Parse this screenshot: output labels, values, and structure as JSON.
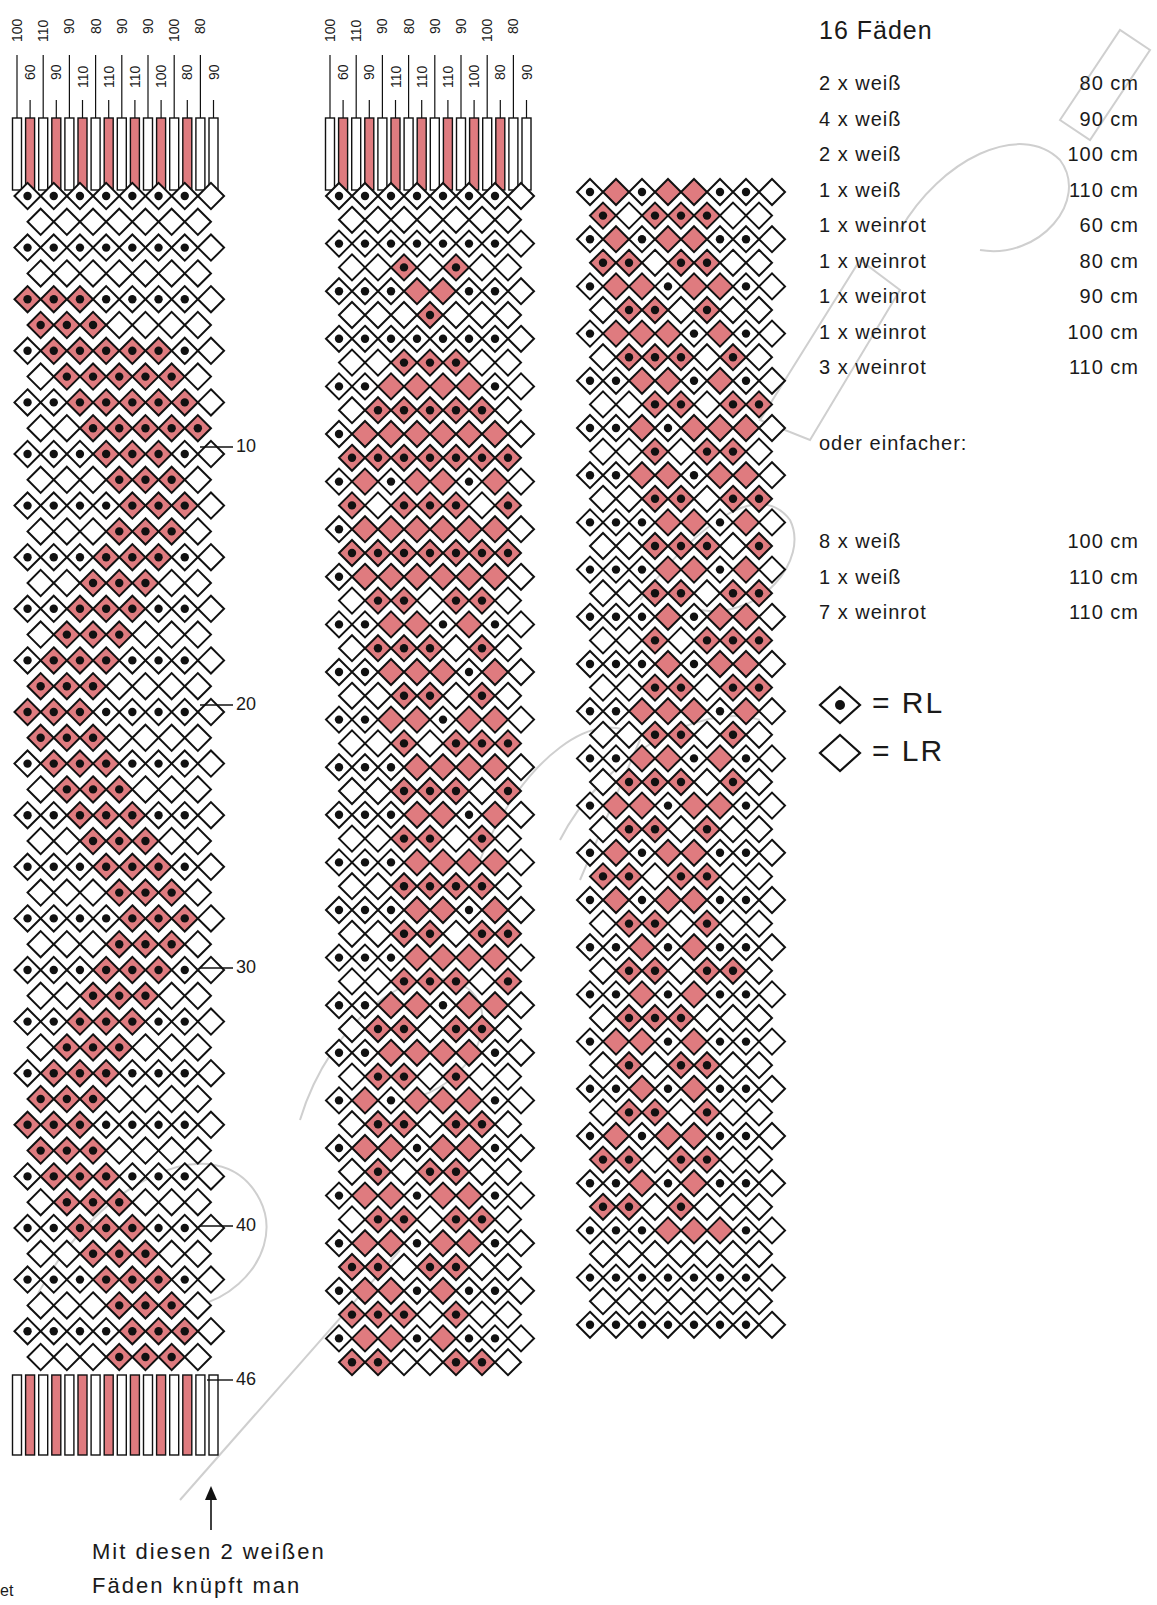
{
  "title": "16 Fäden",
  "colors": {
    "white_thread": "#ffffff",
    "red_thread": "#df7b7f",
    "outline": "#111111",
    "watermark": "#c8c8c8"
  },
  "materials": [
    {
      "qty": "2 x weiß",
      "length": "80 cm"
    },
    {
      "qty": "4 x weiß",
      "length": "90 cm"
    },
    {
      "qty": "2 x weiß",
      "length": "100 cm"
    },
    {
      "qty": "1 x weiß",
      "length": "110 cm"
    },
    {
      "qty": "1 x weinrot",
      "length": "60 cm"
    },
    {
      "qty": "1 x weinrot",
      "length": "80 cm"
    },
    {
      "qty": "1 x weinrot",
      "length": "90 cm"
    },
    {
      "qty": "1 x weinrot",
      "length": "100 cm"
    },
    {
      "qty": "3 x weinrot",
      "length": "110 cm"
    }
  ],
  "simpler_heading": "oder einfacher:",
  "simpler_materials": [
    {
      "qty": "8 x weiß",
      "length": "100 cm"
    },
    {
      "qty": "1 x weiß",
      "length": "110 cm"
    },
    {
      "qty": "7 x weinrot",
      "length": "110 cm"
    }
  ],
  "legend": [
    {
      "symbol": "dotted-diamond",
      "label": "= RL"
    },
    {
      "symbol": "plain-diamond",
      "label": "= LR"
    }
  ],
  "thread_lengths_top": [
    "100",
    "60",
    "110",
    "90",
    "90",
    "110",
    "80",
    "110",
    "90",
    "110",
    "90",
    "100",
    "100",
    "80",
    "80",
    "90"
  ],
  "thread_colors": [
    "w",
    "r",
    "w",
    "r",
    "w",
    "r",
    "w",
    "r",
    "w",
    "r",
    "w",
    "r",
    "w",
    "r",
    "w",
    "w"
  ],
  "row_markers": [
    {
      "label": "10",
      "row": 10
    },
    {
      "label": "20",
      "row": 20
    },
    {
      "label": "30",
      "row": 30
    },
    {
      "label": "40",
      "row": 40
    },
    {
      "label": "46",
      "row": 46
    }
  ],
  "arrow_note": [
    "Mit diesen 2 weißen",
    "Fäden knüpft man"
  ],
  "cut_text": "et",
  "patterns": {
    "left": {
      "rows": 46,
      "description": "Full diamond/zigzag grid, weinrot band forming X then zigzag"
    },
    "middle": {
      "rows": [
        "d d d d d d d .",
        " . . . . . . .",
        "d d d d d d d .",
        " . . R . R . .",
        "d d d r r d d .",
        " . . . R . . .",
        "d d d d d d d .",
        " . . R R R . .",
        "d d r r r r d .",
        " . R R R R R .",
        "d r r r r r r .",
        " R R R R R R R",
        "d r d r r d r .",
        " R . R R R . R",
        "d r r r r r r .",
        " R R R R R R R",
        "d r r r r r r .",
        " . R R . R R .",
        "d d r r d r d .",
        " . R R R . R .",
        "d d r r r d r .",
        " . . R R . R .",
        "d d r r d r r .",
        " . . R . R R R",
        "d d d r r r r .",
        " . . R R R . R",
        "d d d r r d r .",
        " . . R R . R .",
        "d d d r r r r .",
        " . . R R R R .",
        "d d d r r d r .",
        " . . R R . R R",
        "d d d r r r r .",
        " . . R R R . R",
        "d d r r d r r .",
        " . R R . R R .",
        "d d r r r r d .",
        " . R R . R . .",
        "d r d r r r d .",
        " . R R . R R .",
        "d r r d r r d .",
        " . R . R R . .",
        "d r r d r r d .",
        " . R R . R R .",
        "d r r d r r d .",
        " R R . R R . .",
        "d r r d r d d .",
        " R R R . R . .",
        "d r r d r d d .",
        " R R . . R R ."
      ]
    },
    "right": {
      "rows": [
        "d r d r r d d .",
        " R . R R R . .",
        "d r d r r d d .",
        " R R . R R . .",
        "d r r d r r d .",
        " . R R . R . .",
        "d r r r d r d .",
        " . R R R . R .",
        "d d r r d r d .",
        " . . R R . R R",
        "d d r d r r r .",
        " . . R . R R .",
        "d d r r d r r .",
        " . . R R . R R",
        "d d d r r d r .",
        " . . R R R . R",
        "d d d r r d r .",
        " . . R R . R R",
        "d d d r d r r .",
        " . . R . R R R",
        "d d d r d r r .",
        " . . R R . R R",
        "d d r r r d r .",
        " . . R R . R .",
        "d d r r d r d .",
        " . R R R . R .",
        "d r r d r r d .",
        " . R R . R . .",
        "d r d r r d d .",
        " R R . R R . .",
        "d r d r r d d .",
        " . R R . R . .",
        "d d r d r d d .",
        " . R R . R R .",
        "d d r d r d d .",
        " . R R R . . .",
        "d r r d r d d .",
        " . R . R R . .",
        "d d r d r d d .",
        " . R R . R . .",
        "d r d r r d d .",
        " R R . R R . .",
        "d d r d r d d .",
        " R R . R . . .",
        "d d d r r r d .",
        " . . . . . . .",
        "d d d d d d d .",
        " . . . . . . .",
        "d d d d d d d ."
      ]
    }
  }
}
